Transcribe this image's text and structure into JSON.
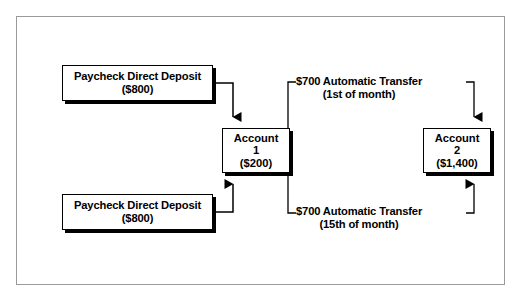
{
  "diagram": {
    "frame_color": "#9a9a9a",
    "ink_color": "#000000",
    "background": "#ffffff",
    "nodes": {
      "deposit_top": {
        "label": "Paycheck Direct Deposit",
        "amount": "($800)"
      },
      "deposit_bottom": {
        "label": "Paycheck Direct Deposit",
        "amount": "($800)"
      },
      "account_1": {
        "label": "Account",
        "number": "1",
        "amount": "($200)"
      },
      "account_2": {
        "label": "Account",
        "number": "2",
        "amount": "($1,400)"
      }
    },
    "edges": {
      "transfer_top": {
        "label": "$700 Automatic Transfer",
        "schedule": "(1st of month)"
      },
      "transfer_bottom": {
        "label": "$700 Automatic Transfer",
        "schedule": "(15th of month)"
      }
    }
  }
}
